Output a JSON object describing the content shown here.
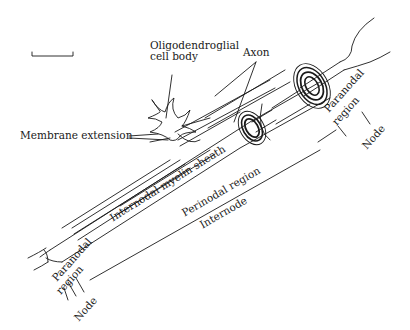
{
  "figure": {
    "type": "anatomical diagram",
    "scale_bar": true,
    "colors": {
      "ink": "#1a1a1a",
      "background": "#ffffff"
    }
  },
  "labels": {
    "oligodendroglial_line1": "Oligodendroglial",
    "oligodendroglial_line2": "cell body",
    "axon": "Axon",
    "membrane_extension": "Membrane extension",
    "internodal_myelin_sheath": "Internodal myelin sheath",
    "perinodal_region": "Perinodal region",
    "internode": "Internode",
    "paranodal_right_line1": "Paranodal",
    "paranodal_right_line2": "region",
    "node_right": "Node",
    "paranodal_left_line1": "Paranodal",
    "paranodal_left_line2": "region",
    "node_left": "Node"
  }
}
